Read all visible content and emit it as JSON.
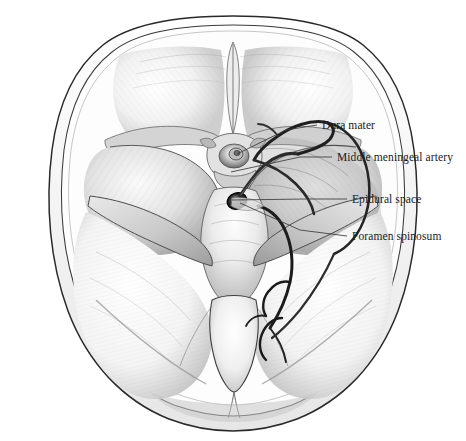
{
  "figure": {
    "background_color": "#ffffff",
    "ink_color": "#1a1a1a",
    "style": "graphite pencil anatomical illustration",
    "view": "superior view of cranial floor, dura partially reflected on the right side"
  },
  "labels": [
    {
      "id": "dura-mater",
      "text": "Dura mater",
      "text_x": 322,
      "text_y": 129,
      "leader": "M 317 125 L 286 130 L 237 154"
    },
    {
      "id": "middle-meningeal-artery",
      "text": "Middle meningeal artery",
      "text_x": 337,
      "text_y": 161,
      "leader": "M 332 157 L 300 157 L 231 172"
    },
    {
      "id": "epidural-space",
      "text": "Epidural space",
      "text_x": 352,
      "text_y": 203,
      "leader": "M 347 199 L 305 199 L 232 200"
    },
    {
      "id": "foramen-spinosum",
      "text": "Foramen spinosum",
      "text_x": 352,
      "text_y": 240,
      "leader": "M 347 236 L 300 230 L 240 203"
    }
  ],
  "anatomy_regions": [
    {
      "name": "anterior-cranial-fossa-left",
      "note": "orbital plate of frontal bone, left"
    },
    {
      "name": "anterior-cranial-fossa-right",
      "note": "orbital plate of frontal bone, right"
    },
    {
      "name": "crista-galli",
      "note": "midline ridge, anterior"
    },
    {
      "name": "sella-turcica",
      "note": "pituitary fossa, center"
    },
    {
      "name": "middle-cranial-fossa-left",
      "note": "temporal fossa, left"
    },
    {
      "name": "middle-cranial-fossa-right",
      "note": "temporal fossa, right, dura shown"
    },
    {
      "name": "petrous-ridge-left",
      "note": "petrous part of temporal bone, left"
    },
    {
      "name": "petrous-ridge-right",
      "note": "petrous part of temporal bone, right"
    },
    {
      "name": "posterior-cranial-fossa-left",
      "note": "cerebellar fossa, left"
    },
    {
      "name": "posterior-cranial-fossa-right",
      "note": "cerebellar fossa, right"
    },
    {
      "name": "foramen-magnum",
      "note": "central opening, posterior"
    },
    {
      "name": "clivus",
      "note": "basilar part of occipital bone"
    },
    {
      "name": "calvarial-margin",
      "note": "sawn skull vault rim, double contour"
    },
    {
      "name": "meningeal-artery-trunk",
      "note": "dark vessel ascending from foramen spinosum"
    },
    {
      "name": "meningeal-artery-frontal-branch",
      "note": "anterior division arching forward"
    },
    {
      "name": "meningeal-artery-parietal-branch",
      "note": "posterior division descending"
    }
  ]
}
